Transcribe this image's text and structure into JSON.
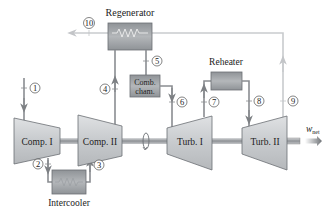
{
  "diagram": {
    "components": {
      "comp1": {
        "label": "Comp. I"
      },
      "comp2": {
        "label": "Comp. II"
      },
      "turb1": {
        "label": "Turb. I"
      },
      "turb2": {
        "label": "Turb. II"
      },
      "regenerator": {
        "label": "Regenerator"
      },
      "combustion": {
        "label_line1": "Comb.",
        "label_line2": "cham."
      },
      "reheater": {
        "label": "Reheater"
      },
      "intercooler": {
        "label": "Intercooler"
      }
    },
    "output": {
      "label_w": "w",
      "label_sub": "net"
    },
    "states": [
      "1",
      "2",
      "3",
      "4",
      "5",
      "6",
      "7",
      "8",
      "9",
      "10"
    ]
  },
  "colors": {
    "machine_fill": "#c9ccd0",
    "machine_stroke": "#6b6f74",
    "pipe": "#8a8d91",
    "exhaust": "#c7c9cc",
    "hx_fill": "#9ea2a6",
    "shaft": "#9a9da1"
  }
}
